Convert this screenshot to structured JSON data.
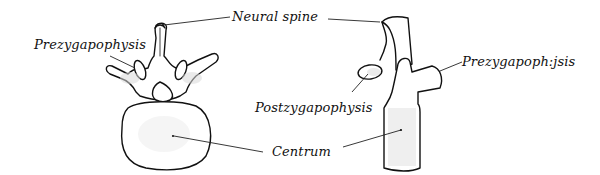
{
  "figure": {
    "type": "vertebra diagram",
    "views": [
      {
        "id": "anterior-view",
        "description": "vertebra, front view"
      },
      {
        "id": "lateral-view",
        "description": "vertebra, side view"
      }
    ]
  },
  "labels": {
    "prezygapophysis_left": "Prezygapophysis",
    "neural_spine": "Neural spine",
    "prezygapophysis_right": "Prezygapoph:jsis",
    "postzygapophysis": "Postzygapophysis",
    "centrum": "Centrum"
  },
  "colors": {
    "ink": "#111111",
    "background": "#ffffff",
    "stipple": "#d8d8d8"
  }
}
